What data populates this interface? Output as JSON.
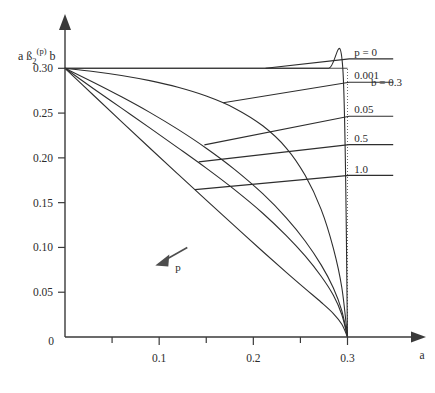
{
  "chart_data": {
    "type": "line",
    "title": "",
    "xlabel": "a",
    "ylabel": "a ß2(p) b",
    "ylabel_parts": {
      "lead": "a ß",
      "sub": "2",
      "sup": "(p)",
      "tail": "b"
    },
    "xlim": [
      0,
      0.36
    ],
    "ylim": [
      0,
      0.345
    ],
    "x_ticks": [
      0,
      0.1,
      0.2,
      0.3
    ],
    "x_tick_labels": [
      "0",
      "0.1",
      "0.2",
      "0.3"
    ],
    "x_minor_ticks": [
      0.05,
      0.15,
      0.25
    ],
    "y_ticks": [
      0.05,
      0.1,
      0.15,
      0.2,
      0.25,
      0.3
    ],
    "y_tick_labels": [
      "0.05",
      "0.10",
      "0.15",
      "0.20",
      "0.25",
      "0.30"
    ],
    "grid": false,
    "legend_position": "right-inline-leaders",
    "annotations": [
      {
        "name": "parameter-note",
        "text": "b = 0.3",
        "x": 0.335,
        "y": 0.285
      },
      {
        "name": "direction-arrow-label",
        "text": "p",
        "x": 0.098,
        "y": 0.082
      }
    ],
    "guides": [
      {
        "name": "horizontal-guide-030",
        "from": [
          0,
          0.3
        ],
        "to": [
          0.3,
          0.3
        ]
      },
      {
        "name": "vertical-dotted-guide-a03",
        "from": [
          0.3,
          0.0
        ],
        "to": [
          0.3,
          0.3
        ]
      }
    ],
    "series": [
      {
        "name": "p = 0",
        "label": "p = 0",
        "p": 0,
        "points": [
          [
            0,
            0.3
          ],
          [
            0.05,
            0.3
          ],
          [
            0.1,
            0.3
          ],
          [
            0.15,
            0.3
          ],
          [
            0.2,
            0.3
          ],
          [
            0.25,
            0.3
          ],
          [
            0.28,
            0.3
          ],
          [
            0.295,
            0.3
          ],
          [
            0.3,
            0.0
          ]
        ],
        "leader_anchor": [
          0.213,
          0.3
        ],
        "label_line_y": 0.3105,
        "label_xy": [
          0.305,
          0.318
        ]
      },
      {
        "name": "p = 0.001",
        "label": "0.001",
        "p": 0.001,
        "points": [
          [
            0,
            0.3
          ],
          [
            0.03,
            0.2965
          ],
          [
            0.06,
            0.292
          ],
          [
            0.09,
            0.2862
          ],
          [
            0.12,
            0.2788
          ],
          [
            0.15,
            0.269
          ],
          [
            0.18,
            0.2555
          ],
          [
            0.21,
            0.2358
          ],
          [
            0.235,
            0.211
          ],
          [
            0.255,
            0.1805
          ],
          [
            0.272,
            0.1425
          ],
          [
            0.285,
            0.099
          ],
          [
            0.294,
            0.055
          ],
          [
            0.3,
            0.0
          ]
        ],
        "leader_anchor": [
          0.168,
          0.2616
        ],
        "label_line_y": 0.2845,
        "label_xy": [
          0.305,
          0.292
        ]
      },
      {
        "name": "p = 0.05",
        "label": "0.05",
        "p": 0.05,
        "points": [
          [
            0,
            0.3
          ],
          [
            0.03,
            0.2845
          ],
          [
            0.06,
            0.2682
          ],
          [
            0.09,
            0.2508
          ],
          [
            0.12,
            0.2318
          ],
          [
            0.15,
            0.2108
          ],
          [
            0.18,
            0.1872
          ],
          [
            0.21,
            0.16
          ],
          [
            0.235,
            0.133
          ],
          [
            0.255,
            0.1072
          ],
          [
            0.272,
            0.0805
          ],
          [
            0.285,
            0.0548
          ],
          [
            0.294,
            0.0292
          ],
          [
            0.3,
            0.0
          ]
        ],
        "leader_anchor": [
          0.148,
          0.2145
        ],
        "label_line_y": 0.2465,
        "label_xy": [
          0.305,
          0.2545
        ]
      },
      {
        "name": "p = 0.5",
        "label": "0.5",
        "p": 0.5,
        "points": [
          [
            0,
            0.3
          ],
          [
            0.03,
            0.2775
          ],
          [
            0.06,
            0.2555
          ],
          [
            0.09,
            0.2335
          ],
          [
            0.12,
            0.2112
          ],
          [
            0.15,
            0.1885
          ],
          [
            0.18,
            0.1645
          ],
          [
            0.21,
            0.1382
          ],
          [
            0.235,
            0.1132
          ],
          [
            0.255,
            0.0905
          ],
          [
            0.272,
            0.0678
          ],
          [
            0.285,
            0.0465
          ],
          [
            0.294,
            0.0248
          ],
          [
            0.3,
            0.0
          ]
        ],
        "leader_anchor": [
          0.142,
          0.1955
        ],
        "label_line_y": 0.2148,
        "label_xy": [
          0.305,
          0.2225
        ]
      },
      {
        "name": "p = 1.0",
        "label": "1.0",
        "p": 1.0,
        "points": [
          [
            0,
            0.3
          ],
          [
            0.03,
            0.2702
          ],
          [
            0.06,
            0.2405
          ],
          [
            0.09,
            0.211
          ],
          [
            0.12,
            0.1818
          ],
          [
            0.15,
            0.1528
          ],
          [
            0.18,
            0.124
          ],
          [
            0.21,
            0.0955
          ],
          [
            0.235,
            0.0722
          ],
          [
            0.255,
            0.054
          ],
          [
            0.272,
            0.0388
          ],
          [
            0.285,
            0.0262
          ],
          [
            0.294,
            0.0142
          ],
          [
            0.3,
            0.0
          ]
        ],
        "leader_anchor": [
          0.138,
          0.1645
        ],
        "label_line_y": 0.1805,
        "label_xy": [
          0.305,
          0.188
        ]
      }
    ]
  }
}
